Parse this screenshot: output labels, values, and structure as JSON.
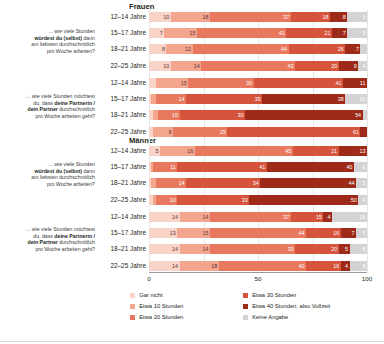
{
  "colors": {
    "gar_nicht": "#f9d2c8",
    "etwa_10": "#f3a58e",
    "etwa_20": "#e8795f",
    "etwa_30": "#d6533c",
    "etwa_40": "#9e2a19",
    "keine_angabe": "#d4d2d4",
    "axis": "#9a9a9a",
    "grid": "#e6e6e6",
    "text": "#231f20"
  },
  "questions": {
    "self": {
      "line1": "... wie viele Stunden",
      "bold1": "würdest du (selbst)",
      "line2": "dann",
      "line3": "am liebsten durchschnittlich",
      "line4": "pro Woche arbeiten?"
    },
    "partner": {
      "line1": "... wie viele Stunden möchtest",
      "line2": "du, dass",
      "bold1": "deine Partnerin /",
      "bold2": "dein Partner",
      "line3": "durchschnittlich",
      "line4": "pro Woche arbeiten geht?"
    }
  },
  "group_headers": {
    "women": "Frauen",
    "men": "Männer"
  },
  "age_labels": [
    "12–14 Jahre",
    "15–17 Jahre",
    "18–21 Jahre",
    "22–25 Jahre"
  ],
  "axis": {
    "ticks": [
      "0",
      "50",
      "100"
    ],
    "tick_values": [
      0,
      50,
      100
    ],
    "min": 0,
    "max": 100
  },
  "legend": {
    "col1": [
      {
        "label": "Gar nicht",
        "color": "#f9d2c8",
        "key": "gar_nicht"
      },
      {
        "label": "Etwa 10 Stunden",
        "color": "#f3a58e",
        "key": "etwa_10"
      },
      {
        "label": "Etwa 20 Stunden",
        "color": "#e8795f",
        "key": "etwa_20"
      }
    ],
    "col2": [
      {
        "label": "Etwa 30 Stunden",
        "color": "#d6533c",
        "key": "etwa_30"
      },
      {
        "label": "Etwa 40 Stunden, also Vollzeit",
        "color": "#9e2a19",
        "key": "etwa_40"
      },
      {
        "label": "Keine Angabe",
        "color": "#d4d2d4",
        "key": "keine_angabe"
      }
    ]
  },
  "chart_data": {
    "type": "bar",
    "orientation": "horizontal",
    "stacked": true,
    "stacked_percent": true,
    "title": "",
    "xlabel": "",
    "ylabel": "",
    "xlim": [
      0,
      100
    ],
    "grid": true,
    "legend_position": "bottom",
    "series_order": [
      "Gar nicht",
      "Etwa 10 Stunden",
      "Etwa 20 Stunden",
      "Etwa 30 Stunden",
      "Etwa 40 Stunden, also Vollzeit",
      "Keine Angabe"
    ],
    "series_colors": [
      "#f9d2c8",
      "#f3a58e",
      "#e8795f",
      "#d6533c",
      "#9e2a19",
      "#d4d2d4"
    ],
    "categories": [
      "12–14 Jahre",
      "15–17 Jahre",
      "18–21 Jahre",
      "22–25 Jahre"
    ],
    "groups": [
      {
        "gender": "Frauen",
        "question": "... wie viele Stunden würdest du (selbst) dann am liebsten durchschnittlich pro Woche arbeiten?",
        "rows": [
          {
            "category": "12–14 Jahre",
            "values": [
              10,
              18,
              37,
              18,
              8,
              9
            ]
          },
          {
            "category": "15–17 Jahre",
            "values": [
              7,
              15,
              41,
              21,
              7,
              9
            ]
          },
          {
            "category": "18–21 Jahre",
            "values": [
              8,
              12,
              44,
              26,
              7,
              3
            ]
          },
          {
            "category": "22–25 Jahre",
            "values": [
              10,
              14,
              43,
              20,
              9,
              4
            ]
          }
        ]
      },
      {
        "gender": "Frauen",
        "question": "... wie viele Stunden möchtest du, dass deine Partnerin / dein Partner durchschnittlich pro Woche arbeiten geht?",
        "rows": [
          {
            "category": "12–14 Jahre",
            "values": [
              3,
              15,
              30,
              41,
              11,
              0
            ]
          },
          {
            "category": "15–17 Jahre",
            "values": [
              1,
              2,
              14,
              35,
              38,
              10
            ]
          },
          {
            "category": "18–21 Jahre",
            "values": [
              2,
              2,
              10,
              30,
              54,
              2
            ]
          },
          {
            "category": "22–25 Jahre",
            "values": [
              2,
              9,
              25,
              61,
              3,
              0
            ]
          }
        ]
      },
      {
        "gender": "Männer",
        "question": "... wie viele Stunden würdest du (selbst) dann am liebsten durchschnittlich pro Woche arbeiten?",
        "rows": [
          {
            "category": "12–14 Jahre",
            "values": [
              5,
              16,
              45,
              21,
              13,
              0
            ]
          },
          {
            "category": "15–17 Jahre",
            "values": [
              1,
              1,
              11,
              41,
              40,
              6
            ]
          },
          {
            "category": "18–21 Jahre",
            "values": [
              1,
              2,
              14,
              34,
              44,
              5
            ]
          },
          {
            "category": "22–25 Jahre",
            "values": [
              2,
              1,
              10,
              33,
              50,
              4
            ]
          }
        ]
      },
      {
        "gender": "Männer",
        "question": "... wie viele Stunden möchtest du, dass deine Partnerin / dein Partner durchschnittlich pro Woche arbeiten geht?",
        "rows": [
          {
            "category": "12–14 Jahre",
            "values": [
              14,
              14,
              37,
              15,
              4,
              16
            ]
          },
          {
            "category": "15–17 Jahre",
            "values": [
              13,
              15,
              44,
              16,
              7,
              5
            ]
          },
          {
            "category": "18–21 Jahre",
            "values": [
              14,
              14,
              39,
              20,
              5,
              8
            ]
          },
          {
            "category": "22–25 Jahre",
            "values": [
              14,
              18,
              40,
              16,
              4,
              8
            ]
          }
        ]
      }
    ]
  }
}
